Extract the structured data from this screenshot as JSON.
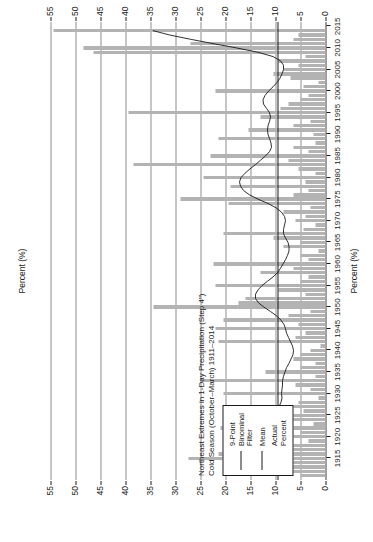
{
  "chart_data": {
    "type": "bar",
    "title": "Northeast Extremes in 1-Day Precipitation (Step 4\")\nCold Season (October–March) 1911–2014",
    "title_line1": "Northeast Extremes in 1-Day Precipitation (Step 4\")",
    "title_line2": "Cold Season (October–March) 1911–2014",
    "xlabel": "",
    "ylabel": "Percent (%)",
    "axis_title_top": "Percent (%)",
    "axis_title_bottom": "Percent (%)",
    "ylim": [
      0,
      57
    ],
    "xlim": [
      1910,
      2016
    ],
    "ytick_labels": [
      "0",
      "5",
      "10",
      "15",
      "20",
      "25",
      "30",
      "35",
      "40",
      "45",
      "50",
      "55"
    ],
    "ytick_values": [
      0,
      5,
      10,
      15,
      20,
      25,
      30,
      35,
      40,
      45,
      50,
      55
    ],
    "xtick_labels": [
      "1915",
      "1920",
      "1925",
      "1930",
      "1935",
      "1940",
      "1945",
      "1950",
      "1955",
      "1960",
      "1965",
      "1970",
      "1975",
      "1980",
      "1985",
      "1990",
      "1995",
      "2000",
      "2005",
      "2010",
      "2015"
    ],
    "xtick_values": [
      1915,
      1920,
      1925,
      1930,
      1935,
      1940,
      1945,
      1950,
      1955,
      1960,
      1965,
      1970,
      1975,
      1980,
      1985,
      1990,
      1995,
      2000,
      2005,
      2010,
      2015
    ],
    "grid": true,
    "legend_position": "left-inset",
    "mean_value": 9.6,
    "bar_color": "#b3b3b3",
    "line_color": "#1a1a1a",
    "grid_color": "#8e8e8e",
    "categories": [
      1911,
      1912,
      1913,
      1914,
      1915,
      1916,
      1917,
      1918,
      1919,
      1920,
      1921,
      1922,
      1923,
      1924,
      1925,
      1926,
      1927,
      1928,
      1929,
      1930,
      1931,
      1932,
      1933,
      1934,
      1935,
      1936,
      1937,
      1938,
      1939,
      1940,
      1941,
      1942,
      1943,
      1944,
      1945,
      1946,
      1947,
      1948,
      1949,
      1950,
      1951,
      1952,
      1953,
      1954,
      1955,
      1956,
      1957,
      1958,
      1959,
      1960,
      1961,
      1962,
      1963,
      1964,
      1965,
      1966,
      1967,
      1968,
      1969,
      1970,
      1971,
      1972,
      1973,
      1974,
      1975,
      1976,
      1977,
      1978,
      1979,
      1980,
      1981,
      1982,
      1983,
      1984,
      1985,
      1986,
      1987,
      1988,
      1989,
      1990,
      1991,
      1992,
      1993,
      1994,
      1995,
      1996,
      1997,
      1998,
      1999,
      2000,
      2001,
      2002,
      2003,
      2004,
      2005,
      2006,
      2007,
      2008,
      2009,
      2010,
      2011,
      2012,
      2013,
      2014
    ],
    "series": [
      {
        "name": "Actual Percent",
        "values": [
          5.0,
          7.5,
          11.5,
          16.0,
          27.5,
          21.5,
          13.0,
          9.0,
          3.5,
          19.5,
          5.0,
          21.0,
          2.5,
          8.0,
          20.5,
          4.5,
          8.5,
          5.5,
          1.5,
          20.5,
          3.0,
          6.0,
          25.0,
          2.0,
          12.0,
          5.0,
          2.0,
          6.5,
          5.0,
          3.0,
          1.0,
          21.5,
          6.0,
          4.0,
          22.0,
          5.5,
          20.5,
          7.5,
          3.0,
          34.5,
          17.5,
          16.0,
          4.0,
          9.5,
          22.0,
          5.0,
          3.5,
          13.0,
          6.5,
          22.5,
          3.5,
          5.0,
          1.5,
          8.5,
          5.0,
          10.5,
          20.5,
          4.5,
          2.0,
          6.0,
          4.0,
          8.5,
          3.0,
          19.5,
          29.0,
          6.5,
          3.5,
          19.0,
          4.0,
          24.5,
          2.0,
          5.5,
          38.5,
          7.5,
          23.0,
          3.5,
          6.5,
          2.0,
          21.5,
          2.5,
          15.5,
          6.5,
          3.0,
          13.0,
          39.5,
          9.0,
          7.5,
          5.0,
          3.5,
          22.0,
          4.5,
          1.5,
          7.0,
          10.5,
          8.5,
          5.5,
          9.5,
          4.0,
          46.5,
          48.5,
          27.0,
          6.5,
          5.5,
          54.5
        ]
      },
      {
        "name": "9-Point Binominal Filter",
        "values": [
          6.5,
          8.2,
          10.5,
          13.0,
          15.2,
          16.1,
          15.6,
          14.0,
          12.4,
          11.2,
          10.4,
          10.0,
          9.8,
          9.7,
          9.8,
          9.6,
          9.3,
          8.9,
          8.7,
          8.8,
          8.7,
          8.6,
          8.6,
          8.4,
          8.1,
          7.8,
          7.3,
          6.9,
          6.5,
          6.4,
          6.6,
          7.0,
          7.4,
          7.8,
          8.0,
          8.3,
          8.9,
          9.8,
          11.0,
          12.3,
          13.4,
          14.0,
          14.0,
          13.5,
          12.7,
          11.6,
          10.5,
          9.6,
          9.0,
          8.5,
          8.0,
          7.6,
          7.3,
          7.3,
          7.5,
          8.0,
          8.4,
          8.4,
          8.2,
          8.0,
          8.2,
          8.8,
          9.9,
          11.5,
          13.5,
          15.2,
          16.4,
          17.0,
          17.2,
          16.9,
          16.1,
          15.1,
          14.0,
          13.0,
          12.0,
          11.2,
          10.8,
          10.9,
          11.2,
          11.5,
          11.6,
          11.5,
          11.2,
          11.0,
          11.2,
          11.8,
          12.4,
          12.5,
          12.1,
          11.4,
          10.5,
          9.7,
          9.1,
          8.7,
          8.4,
          8.4,
          9.0,
          10.5,
          13.5,
          17.8,
          22.5,
          27.0,
          31.2,
          34.5
        ]
      },
      {
        "name": "Mean",
        "value": 9.6,
        "type": "horizontal-reference-line"
      }
    ]
  },
  "legend": {
    "items": [
      {
        "label": "9-Point\nBinominal\nFilter",
        "swatch": "line"
      },
      {
        "label": "Mean",
        "swatch": "line"
      },
      {
        "label": "Actual\nPercent",
        "swatch": "bars"
      }
    ]
  }
}
